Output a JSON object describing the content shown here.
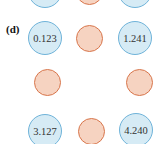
{
  "panel": {
    "label": "(d)"
  },
  "colors": {
    "blue_fill": "#d6ebf5",
    "blue_stroke": "#6fb3d9",
    "orange_fill": "#f6d3c1",
    "orange_stroke": "#d8764c"
  },
  "nodes": {
    "top_left": {
      "value": "0.123",
      "type": "blue"
    },
    "top_middle": {
      "value": "",
      "type": "orange"
    },
    "top_right": {
      "value": "1.241",
      "type": "blue"
    },
    "middle_left": {
      "value": "",
      "type": "orange"
    },
    "middle_right": {
      "value": "",
      "type": "orange"
    },
    "bottom_left": {
      "value": "3.127",
      "type": "blue"
    },
    "bottom_middle": {
      "value": "",
      "type": "orange"
    },
    "bottom_right": {
      "value": "4.240",
      "type": "blue"
    }
  }
}
